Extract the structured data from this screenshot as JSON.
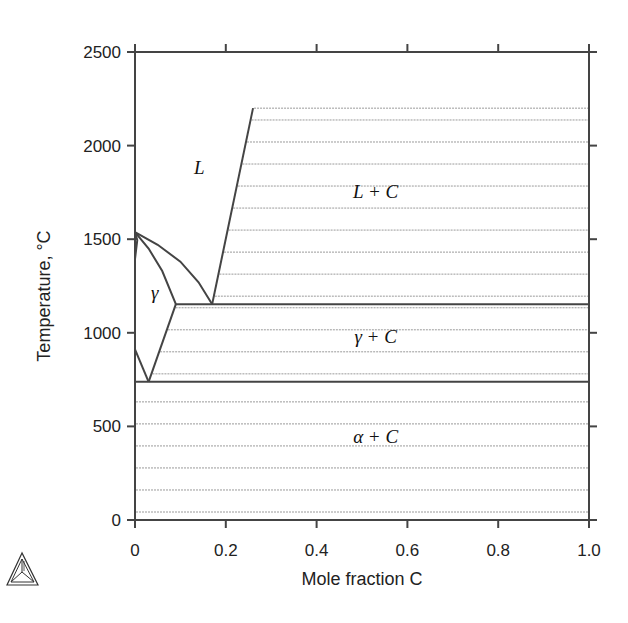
{
  "chart_data": {
    "type": "line",
    "title": "",
    "xlabel": "Mole fraction C",
    "ylabel": "Temperature, °C",
    "xlim": [
      0,
      1.0
    ],
    "ylim": [
      0,
      2500
    ],
    "x_ticks": [
      0,
      0.2,
      0.4,
      0.6,
      0.8,
      1.0
    ],
    "x_tick_labels": [
      "0",
      "0.2",
      "0.4",
      "0.6",
      "0.8",
      "1.0"
    ],
    "y_ticks": [
      0,
      500,
      1000,
      1500,
      2000,
      2500
    ],
    "y_tick_labels": [
      "0",
      "500",
      "1000",
      "1500",
      "2000",
      "2500"
    ],
    "grid": false,
    "series": [
      {
        "name": "liquidus-left",
        "points": [
          [
            0,
            1538
          ],
          [
            0.05,
            1470
          ],
          [
            0.1,
            1380
          ],
          [
            0.14,
            1270
          ],
          [
            0.17,
            1153
          ]
        ]
      },
      {
        "name": "liquidus-right",
        "points": [
          [
            0.17,
            1153
          ],
          [
            0.26,
            2200
          ]
        ]
      },
      {
        "name": "solidus",
        "points": [
          [
            0,
            1538
          ],
          [
            0.03,
            1450
          ],
          [
            0.06,
            1330
          ],
          [
            0.09,
            1153
          ]
        ]
      },
      {
        "name": "delta-region",
        "points": [
          [
            0,
            1538
          ],
          [
            0.005,
            1495
          ],
          [
            0,
            1394
          ]
        ]
      },
      {
        "name": "gamma-solvus",
        "points": [
          [
            0.09,
            1153
          ],
          [
            0.03,
            738
          ]
        ]
      },
      {
        "name": "alpha-gamma-boundary",
        "points": [
          [
            0,
            912
          ],
          [
            0.03,
            738
          ]
        ]
      },
      {
        "name": "eutectic-isotherm",
        "points": [
          [
            0.09,
            1153
          ],
          [
            1.0,
            1153
          ]
        ]
      },
      {
        "name": "eutectoid-isotherm",
        "points": [
          [
            0,
            738
          ],
          [
            1.0,
            738
          ]
        ]
      }
    ],
    "hatch_regions": [
      {
        "name": "L+C",
        "x_left_boundary": "liquidus-right",
        "y_range": [
          1153,
          2200
        ]
      },
      {
        "name": "gamma+C",
        "x_left_boundary": "gamma-solvus",
        "y_range": [
          738,
          1153
        ]
      },
      {
        "name": "alpha+C",
        "x_left_boundary": 0,
        "y_range": [
          0,
          738
        ]
      }
    ],
    "annotations": [
      {
        "text": "L",
        "x": 0.13,
        "y": 1850
      },
      {
        "text": "L + C",
        "x": 0.53,
        "y": 1720
      },
      {
        "text": "γ",
        "x": 0.035,
        "y": 1180
      },
      {
        "text": "γ + C",
        "x": 0.53,
        "y": 945
      },
      {
        "text": "α + C",
        "x": 0.53,
        "y": 410
      }
    ]
  },
  "logo": {
    "icon": "thermo-calc-triangle-icon"
  }
}
